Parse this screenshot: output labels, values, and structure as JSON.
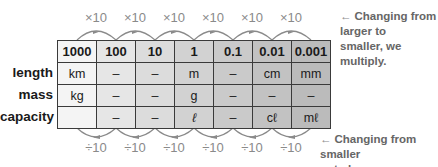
{
  "table": {
    "place_values": [
      "1000",
      "100",
      "10",
      "1",
      "0.1",
      "0.01",
      "0.001"
    ],
    "rows": [
      {
        "label": "length",
        "cells": [
          "km",
          "–",
          "–",
          "m",
          "–",
          "cm",
          "mm"
        ]
      },
      {
        "label": "mass",
        "cells": [
          "kg",
          "–",
          "–",
          "g",
          "–",
          "–",
          "–"
        ]
      },
      {
        "label": "capacity",
        "cells": [
          "",
          "–",
          "–",
          "ℓ",
          "–",
          "cℓ",
          "mℓ"
        ]
      }
    ],
    "column_shades": [
      "#f4f4f4",
      "#e6e6e6",
      "#dcdcdc",
      "#d2d2d2",
      "#cacaca",
      "#c2c2c2",
      "#bbbbbb"
    ]
  },
  "multiply": {
    "labels": [
      "×10",
      "×10",
      "×10",
      "×10",
      "×10",
      "×10"
    ],
    "note_arrow": "←",
    "note_line1": "Changing from larger to",
    "note_line2": "smaller, we multiply."
  },
  "divide": {
    "labels": [
      "÷10",
      "÷10",
      "÷10",
      "÷10",
      "÷10",
      "÷10"
    ],
    "note_arrow": "←",
    "note_line1": "Changing from smaller",
    "note_line2": "to larger, we divide."
  },
  "colors": {
    "arc": "#8a8a8a",
    "border": "#3a3a3a",
    "note_text": "#666666"
  }
}
